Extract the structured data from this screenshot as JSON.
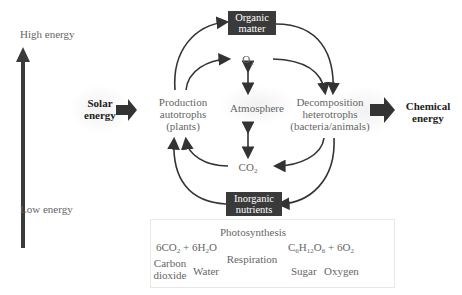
{
  "energy_axis": {
    "high_label": "High energy",
    "low_label": "Low energy"
  },
  "inputs": {
    "solar_line1": "Solar",
    "solar_line2": "energy"
  },
  "outputs": {
    "chemical_line1": "Chemical",
    "chemical_line2": "energy"
  },
  "nodes": {
    "organic_line1": "Organic",
    "organic_line2": "matter",
    "inorganic_line1": "Inorganic",
    "inorganic_line2": "nutrients",
    "production_line1": "Production",
    "production_line2": "autotrophs",
    "production_line3": "(plants)",
    "decomposition_line1": "Decomposition",
    "decomposition_line2": "heterotrophs",
    "decomposition_line3": "(bacteria/animals)",
    "atmosphere": "Atmosphere",
    "o2": "O",
    "o2_sub": "2",
    "co2": "CO",
    "co2_sub": "2"
  },
  "equation": {
    "photosynthesis": "Photosynthesis",
    "respiration": "Respiration",
    "left_a": "6CO",
    "left_a_sub": "2",
    "left_plus": " + 6H",
    "left_b_sub": "2",
    "left_b_end": "O",
    "right_c": "C",
    "right_c_sub": "6",
    "right_h": "H",
    "right_h_sub": "12",
    "right_o": "O",
    "right_o_sub": "6",
    "right_plus": " + 6O",
    "right_o2_sub": "2",
    "label_carbon_1": "Carbon",
    "label_carbon_2": "dioxide",
    "label_water": "Water",
    "label_sugar": "Sugar",
    "label_oxygen": "Oxygen"
  },
  "colors": {
    "arrow": "#333333",
    "box": "#3a3a3a",
    "text": "#666666"
  }
}
